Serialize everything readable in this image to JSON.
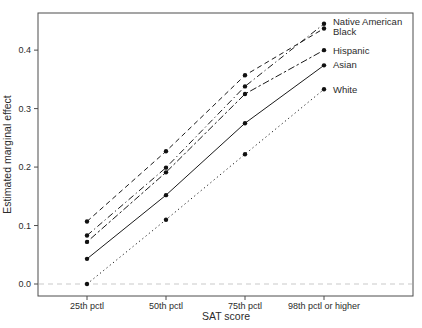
{
  "figure": {
    "background_color": "#ffffff",
    "frame_color": "#4d4d4d",
    "line_color": "#1a1a1a",
    "point_color": "#111111",
    "text_color": "#2b2b2b",
    "zero_line_color": "#c9c9c9"
  },
  "chart_data": {
    "type": "line",
    "title": "",
    "xlabel": "SAT score",
    "ylabel": "Estimated marginal effect",
    "categories": [
      "25th pctl",
      "50th pctl",
      "75th pctl",
      "98th pctl or higher"
    ],
    "ytick_labels": [
      "0.0",
      "0.1",
      "0.2",
      "0.3",
      "0.4"
    ],
    "yticks": [
      0.0,
      0.1,
      0.2,
      0.3,
      0.4
    ],
    "ylim": [
      -0.0205,
      0.4635
    ],
    "grid": false,
    "legend_position": "right-end-of-line-labels",
    "reference_line_y": 0.0,
    "marker": "filled-circle",
    "series": [
      {
        "name": "Black",
        "values": [
          0.107,
          0.227,
          0.357,
          0.437
        ],
        "linestyle": "dashed",
        "label_dy": 3
      },
      {
        "name": "Native American",
        "values": [
          0.083,
          0.199,
          0.338,
          0.445
        ],
        "linestyle": "dotdash",
        "label_dy": -2
      },
      {
        "name": "Hispanic",
        "values": [
          0.072,
          0.191,
          0.325,
          0.4
        ],
        "linestyle": "twodash",
        "label_dy": 0
      },
      {
        "name": "Asian",
        "values": [
          0.043,
          0.152,
          0.275,
          0.374
        ],
        "linestyle": "solid",
        "label_dy": -1
      },
      {
        "name": "White",
        "values": [
          0.0,
          0.11,
          0.222,
          0.333
        ],
        "linestyle": "dotted",
        "label_dy": 0
      }
    ]
  }
}
